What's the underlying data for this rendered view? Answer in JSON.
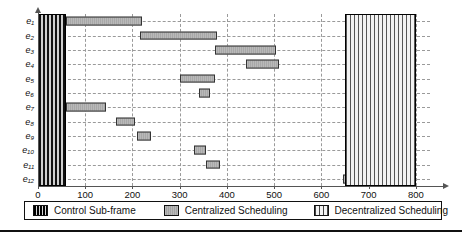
{
  "chart_data": {
    "type": "bar",
    "orientation": "horizontal",
    "title": "",
    "subtitle": "",
    "xlabel": "",
    "ylabel": "",
    "xlim": [
      0,
      830
    ],
    "xticks": [
      0,
      100,
      200,
      300,
      400,
      500,
      600,
      700,
      800
    ],
    "xtick_labels": [
      "0",
      "100",
      "200",
      "300",
      "400",
      "500",
      "600",
      "700",
      "800"
    ],
    "categories": [
      "e1",
      "e2",
      "e3",
      "e4",
      "e5",
      "e6",
      "e7",
      "e8",
      "e9",
      "e10",
      "e11",
      "e12"
    ],
    "category_labels": [
      "e₁",
      "e₂",
      "e₃",
      "e₄",
      "e₅",
      "e₆",
      "e₇",
      "e₈",
      "e₉",
      "e₁₀",
      "e₁₁",
      "e₁₂"
    ],
    "grid": true,
    "grid_style": "dashed",
    "legend_position": "bottom",
    "series": [
      {
        "name": "Control Sub-frame",
        "kind": "span-block",
        "color": "#111111",
        "pattern": "vertical-stripes",
        "start": 0,
        "end": 60,
        "spans_all_rows": true
      },
      {
        "name": "Centralized Scheduling",
        "kind": "bars",
        "color": "#b2b2b2",
        "pattern": "fine-vertical-lines",
        "bars": [
          {
            "row": "e1",
            "start": 60,
            "end": 220
          },
          {
            "row": "e2",
            "start": 215,
            "end": 380
          },
          {
            "row": "e3",
            "start": 375,
            "end": 505
          },
          {
            "row": "e4",
            "start": 440,
            "end": 510
          },
          {
            "row": "e5",
            "start": 300,
            "end": 375
          },
          {
            "row": "e6",
            "start": 340,
            "end": 365
          },
          {
            "row": "e7",
            "start": 60,
            "end": 145
          },
          {
            "row": "e8",
            "start": 165,
            "end": 205
          },
          {
            "row": "e9",
            "start": 210,
            "end": 240
          },
          {
            "row": "e10",
            "start": 330,
            "end": 355
          },
          {
            "row": "e11",
            "start": 355,
            "end": 385
          },
          {
            "row": "e12",
            "start": 645,
            "end": 660
          }
        ]
      },
      {
        "name": "Decentralized Scheduling",
        "kind": "span-block",
        "color": "#f4f4f4",
        "pattern": "grid-crosshatch",
        "start": 650,
        "end": 800,
        "spans_all_rows": true
      }
    ]
  },
  "legend": {
    "items": [
      {
        "label": "Control Sub-frame",
        "swatch": "control-swatch"
      },
      {
        "label": "Centralized Scheduling",
        "swatch": "centralized-swatch"
      },
      {
        "label": "Decentralized Scheduling",
        "swatch": "decentralized-swatch"
      }
    ]
  }
}
